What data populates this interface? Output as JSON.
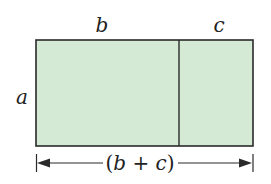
{
  "diagram": {
    "labels": {
      "top_left": "b",
      "top_right": "c",
      "side": "a",
      "bottom_open": "(",
      "bottom_b": "b",
      "bottom_plus": " + ",
      "bottom_c": "c",
      "bottom_close": ")"
    },
    "colors": {
      "fill": "#d4ead4",
      "stroke": "#2a2a2a",
      "text": "#222222"
    },
    "shapes": {
      "outer_rect": {
        "x": 36,
        "y": 40,
        "width": 217,
        "height": 106
      },
      "divider_x": 179,
      "dimension_line_y": 163
    }
  }
}
